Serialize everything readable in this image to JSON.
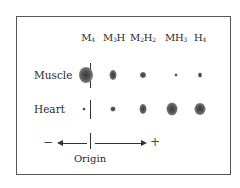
{
  "diagram": {
    "title": "",
    "columns": [
      {
        "label": "M",
        "sub": "4",
        "x": 88
      },
      {
        "label": "M",
        "sub": "3",
        "suffix": "H",
        "x": 114
      },
      {
        "label": "M",
        "sub": "2",
        "suffix": "H",
        "suffix_sub": "2",
        "x": 143
      },
      {
        "label": "MH",
        "sub": "3",
        "x": 176
      },
      {
        "label": "H",
        "sub": "4",
        "x": 200
      }
    ],
    "column_labels": [
      "M4",
      "M3H",
      "M2H2",
      "MH3",
      "H4"
    ],
    "rows": [
      {
        "label": "Muscle",
        "y": 75,
        "spots": [
          {
            "isozyme": "M4",
            "x": 86,
            "w": 14,
            "h": 16
          },
          {
            "isozyme": "M3H",
            "x": 113,
            "w": 7,
            "h": 10
          },
          {
            "isozyme": "M2H2",
            "x": 143,
            "w": 6,
            "h": 6
          },
          {
            "isozyme": "MH3",
            "x": 176,
            "w": 3,
            "h": 3
          },
          {
            "isozyme": "H4",
            "x": 200,
            "w": 4,
            "h": 5
          }
        ]
      },
      {
        "label": "Heart",
        "y": 109,
        "spots": [
          {
            "isozyme": "M4",
            "x": 84,
            "w": 3,
            "h": 3
          },
          {
            "isozyme": "M3H",
            "x": 113,
            "w": 5,
            "h": 5
          },
          {
            "isozyme": "M2H2",
            "x": 143,
            "w": 7,
            "h": 10
          },
          {
            "isozyme": "MH3",
            "x": 172,
            "w": 11,
            "h": 13
          },
          {
            "isozyme": "H4",
            "x": 200,
            "w": 11,
            "h": 12
          }
        ]
      }
    ],
    "row_labels": [
      "Muscle",
      "Heart"
    ],
    "axis": {
      "negative_sign": "−",
      "positive_sign": "+",
      "origin_label": "Origin"
    }
  }
}
